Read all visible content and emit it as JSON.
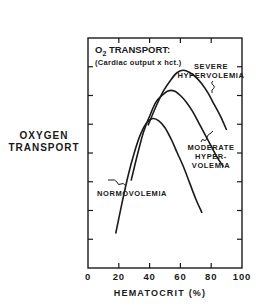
{
  "chart_data": {
    "type": "line",
    "title": "O2 TRANSPORT:",
    "title_main": "O",
    "title_sub": "2",
    "title_rest": " TRANSPORT:",
    "subtitle": "(Cardiac output x hct.)",
    "xlabel": "HEMATOCRIT (%)",
    "ylabel_line1": "OXYGEN",
    "ylabel_line2": "TRANSPORT",
    "xlim": [
      0,
      100
    ],
    "ylim": [
      0,
      10
    ],
    "x_ticks": [
      0,
      20,
      40,
      60,
      80,
      100
    ],
    "x_tick_labels": [
      "0",
      "20",
      "40",
      "60",
      "80",
      "100"
    ],
    "y_ticks_unlabeled": [
      1.25,
      2.5,
      3.75,
      5,
      6.25,
      7.5,
      8.75
    ],
    "grid": false,
    "legend": "inline annotations",
    "series": [
      {
        "name": "NORMOVOLEMIA",
        "x": [
          18,
          22,
          26,
          30,
          34,
          38,
          42,
          46,
          50,
          54,
          58,
          62,
          66,
          70,
          74
        ],
        "y": [
          1.5,
          2.8,
          4.0,
          5.0,
          5.8,
          6.3,
          6.5,
          6.4,
          6.1,
          5.6,
          5.0,
          4.4,
          3.7,
          3.0,
          2.4
        ]
      },
      {
        "name": "MODERATE HYPERVOLEMIA",
        "x": [
          28,
          32,
          36,
          40,
          44,
          48,
          52,
          56,
          60,
          64,
          68,
          72,
          76,
          80,
          84,
          88
        ],
        "y": [
          3.8,
          4.9,
          5.9,
          6.6,
          7.2,
          7.5,
          7.7,
          7.7,
          7.5,
          7.2,
          6.8,
          6.3,
          5.8,
          5.3,
          4.8,
          4.4
        ]
      },
      {
        "name": "SEVERE HYPERVOLEMIA",
        "x": [
          39,
          44,
          49,
          54,
          58,
          62,
          66,
          70,
          74,
          78,
          82,
          86,
          90
        ],
        "y": [
          6.2,
          7.0,
          7.7,
          8.2,
          8.5,
          8.6,
          8.5,
          8.3,
          8.0,
          7.6,
          7.1,
          6.6,
          6.0
        ]
      }
    ],
    "annotations": [
      {
        "text_lines": [
          "SEVERE",
          "HYPERVOLEMIA"
        ],
        "points_to": "SEVERE HYPERVOLEMIA"
      },
      {
        "text_lines": [
          "MODERATE",
          "HYPER-",
          "VOLEMIA"
        ],
        "points_to": "MODERATE HYPERVOLEMIA"
      },
      {
        "text_lines": [
          "NORMOVOLEMIA"
        ],
        "points_to": "NORMOVOLEMIA"
      }
    ]
  },
  "labels": {
    "ylabel_line1": "OXYGEN",
    "ylabel_line2": "TRANSPORT",
    "xlabel": "HEMATOCRIT (%)",
    "title_o": "O",
    "title_sub": "2",
    "title_rest": " TRANSPORT:",
    "subtitle": "(Cardiac output x hct.)",
    "severe_1": "SEVERE",
    "severe_2": "HYPERVOLEMIA",
    "moderate_1": "MODERATE",
    "moderate_2": "HYPER-",
    "moderate_3": "VOLEMIA",
    "normo": "NORMOVOLEMIA"
  },
  "colors": {
    "ink": "#1a1a1a",
    "background": "#ffffff"
  }
}
